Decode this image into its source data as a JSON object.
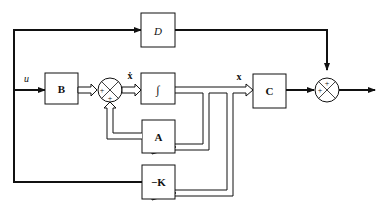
{
  "diagram": {
    "type": "state-space block diagram with state feedback",
    "signals": {
      "input": "u",
      "state_derivative": "ẋ",
      "state": "x"
    },
    "blocks": {
      "D": "D",
      "B": "B",
      "integrator": "∫",
      "A": "A",
      "C": "C",
      "K": "−K"
    },
    "summing_junctions": {
      "state_sum": [
        "+",
        "+"
      ],
      "output_sum": [
        "+",
        "+"
      ]
    },
    "colors": {
      "line": "#111111",
      "background": "#ffffff"
    }
  }
}
